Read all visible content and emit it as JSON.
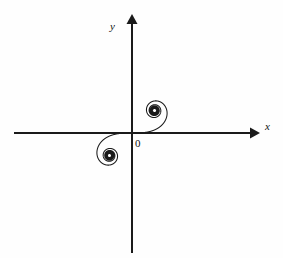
{
  "figure": {
    "background_color": "#fefefe",
    "stroke_color": "#1a1a1a",
    "width": 283,
    "height": 258
  },
  "labels": {
    "y_axis": "y",
    "x_axis": "x",
    "origin": "0"
  },
  "icons": {
    "x_axis_arrow": "arrow-right-icon",
    "y_axis_arrow": "arrow-up-icon"
  },
  "chart_data": {
    "type": "line",
    "xlabel": "x",
    "ylabel": "y",
    "grid": false,
    "legend": null,
    "annotations": [
      "0"
    ],
    "axes": {
      "origin_px": [
        132,
        133
      ],
      "x_axis_px": {
        "x_start": 14,
        "x_end": 258,
        "y": 133,
        "arrow_end": "right"
      },
      "y_axis_px": {
        "y_start": 16,
        "y_end": 253,
        "x": 132,
        "arrow_end": "up"
      },
      "x_range_units": [
        -2.6,
        2.8
      ],
      "y_range_units": [
        -2.6,
        2.6
      ],
      "px_per_unit": 45
    },
    "curve": {
      "name": "Euler spiral",
      "parametric_form": "x(t) = C(t) = ∫0..t cos(πu²/2) du,  y(t) = S(t) = ∫0..t sin(πu²/2) du",
      "t_range": [
        -7.2,
        7.2
      ],
      "asymptotic_points": [
        {
          "label": "upper-right spiral center",
          "xy_units": [
            0.5,
            0.5
          ],
          "xy_px": [
            214,
            40
          ]
        },
        {
          "label": "lower-left spiral center",
          "xy_units": [
            -0.5,
            -0.5
          ],
          "xy_px": [
            51,
            222
          ]
        }
      ],
      "inflection_point": {
        "xy_units": [
          0,
          0
        ],
        "xy_px": [
          132,
          133
        ]
      },
      "symmetry": "odd / point-symmetric about the origin",
      "samples_units": [
        [
          -0.5055,
          -0.4922
        ],
        [
          -0.4415,
          -0.5696
        ],
        [
          -0.3935,
          -0.4542
        ],
        [
          -0.5349,
          -0.435
        ],
        [
          -0.5729,
          -0.5954
        ],
        [
          -0.3317,
          -0.5993
        ],
        [
          -0.3317,
          -0.4099
        ],
        [
          -0.6058,
          -0.5192
        ],
        [
          -0.4693,
          -0.6975
        ],
        [
          -0.258,
          -0.4205
        ],
        [
          -0.5431,
          -0.3083
        ],
        [
          -0.6057,
          -0.6891
        ],
        [
          -0.3096,
          -0.6269
        ],
        [
          -0.2202,
          -0.3437
        ],
        [
          -0.6863,
          -0.4329
        ],
        [
          -0.4383,
          -0.7799
        ],
        [
          -0.2274,
          -0.5188
        ],
        [
          -0.4453,
          -0.2341
        ],
        [
          -0.7799,
          -0.5801
        ],
        [
          -0.2885,
          -0.7287
        ],
        [
          -0.1784,
          -0.338
        ],
        [
          -0.7228,
          -0.2335
        ],
        [
          -0.7799,
          -0.7694
        ],
        [
          -0.1107,
          -0.6002
        ],
        [
          -0.3183,
          -0.155
        ],
        [
          -0.8939,
          -0.4681
        ],
        [
          -0.2218,
          -0.8891
        ],
        [
          -0.0984,
          -0.2443
        ],
        [
          -0.7369,
          -0.0693
        ],
        [
          -0.8652,
          -0.8731
        ],
        [
          -0.0583,
          -0.6575
        ],
        [
          -0.1386,
          -0.0331
        ],
        [
          -1.0,
          -0.3113
        ],
        [
          -0.054,
          -0.975
        ],
        [
          -0.1211,
          -0.08
        ],
        [
          -0.6234,
          0.0886
        ],
        [
          -0.9207,
          -0.9045
        ],
        [
          -0.1217,
          -0.5519
        ],
        [
          0.0,
          0.0
        ],
        [
          0.1217,
          0.5519
        ],
        [
          0.9207,
          0.9045
        ],
        [
          0.6234,
          -0.0886
        ],
        [
          0.1211,
          0.08
        ],
        [
          0.054,
          0.975
        ],
        [
          1.0,
          0.3113
        ],
        [
          0.1386,
          0.0331
        ],
        [
          0.0583,
          0.6575
        ],
        [
          0.8652,
          0.8731
        ],
        [
          0.7369,
          0.0693
        ],
        [
          0.0984,
          0.2443
        ],
        [
          0.2218,
          0.8891
        ],
        [
          0.8939,
          0.4681
        ],
        [
          0.3183,
          0.155
        ],
        [
          0.1107,
          0.6002
        ],
        [
          0.7799,
          0.7694
        ],
        [
          0.7228,
          0.2335
        ],
        [
          0.1784,
          0.338
        ],
        [
          0.2885,
          0.7287
        ],
        [
          0.7799,
          0.5801
        ],
        [
          0.4453,
          0.2341
        ],
        [
          0.2274,
          0.5188
        ],
        [
          0.4383,
          0.7799
        ],
        [
          0.6863,
          0.4329
        ],
        [
          0.2202,
          0.3437
        ],
        [
          0.3096,
          0.6269
        ],
        [
          0.6057,
          0.6891
        ],
        [
          0.5431,
          0.3083
        ],
        [
          0.258,
          0.4205
        ],
        [
          0.4693,
          0.6975
        ],
        [
          0.6058,
          0.5192
        ],
        [
          0.3317,
          0.4099
        ],
        [
          0.3317,
          0.5993
        ],
        [
          0.5729,
          0.5954
        ],
        [
          0.5349,
          0.435
        ],
        [
          0.3935,
          0.4542
        ],
        [
          0.4415,
          0.5696
        ],
        [
          0.5055,
          0.4922
        ]
      ]
    }
  }
}
